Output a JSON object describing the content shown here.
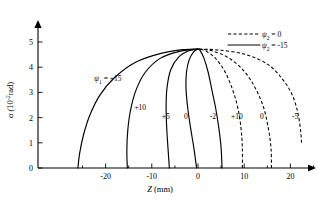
{
  "figure": {
    "title": "",
    "background_color": "#ffffff",
    "line_color": "#000000"
  },
  "axes": {
    "x": {
      "label_symbol": "Z",
      "label_units": "(mm)",
      "label_full": "Z (mm)",
      "ticks": [
        -20,
        -10,
        0,
        10,
        20
      ],
      "tick_labels": [
        "-20",
        "-10",
        "0",
        "10",
        "20"
      ],
      "minor_ticks": [
        -25,
        -15,
        -5,
        5,
        15,
        25
      ],
      "range": [
        -27,
        24
      ]
    },
    "y": {
      "label_symbol": "α",
      "label_units": "(10⁻² rad)",
      "label_full": "α (10⁻² rad)",
      "label_base": "10",
      "label_exponent": "-2",
      "label_unit_name": "rad",
      "ticks": [
        0,
        1,
        2,
        3,
        4,
        5
      ],
      "tick_labels": [
        "0",
        "1",
        "2",
        "3",
        "4",
        "5"
      ],
      "range": [
        0,
        5.5
      ]
    }
  },
  "legend": {
    "position": "top-right",
    "entries": [
      {
        "symbol": "ψ",
        "subscript": "2",
        "equals": "=",
        "value": "0",
        "text": "ψ₂ = 0",
        "style": "dashed"
      },
      {
        "symbol": "ψ",
        "subscript": "2",
        "equals": "=",
        "value": "-15",
        "text": "ψ₂ = -15",
        "style": "solid"
      }
    ]
  },
  "chart_data": {
    "type": "line",
    "title": "",
    "xlabel": "Z (mm)",
    "ylabel": "α (10⁻² rad)",
    "xlim": [
      -27,
      24
    ],
    "ylim": [
      0,
      5.5
    ],
    "grid": false,
    "legend_position": "top-right",
    "convergence_point": {
      "z": 0.0,
      "alpha": 4.72
    },
    "series": [
      {
        "name": "ψ₁ = +15",
        "label": "ψ₁ = +15",
        "style": "solid",
        "label_position": {
          "z": -19.5,
          "alpha": 3.45
        },
        "points": [
          {
            "z": -26.0,
            "alpha": 0.0
          },
          {
            "z": -25.6,
            "alpha": 0.6
          },
          {
            "z": -24.8,
            "alpha": 1.3
          },
          {
            "z": -23.4,
            "alpha": 2.1
          },
          {
            "z": -21.2,
            "alpha": 2.9
          },
          {
            "z": -18.0,
            "alpha": 3.6
          },
          {
            "z": -13.5,
            "alpha": 4.2
          },
          {
            "z": -8.0,
            "alpha": 4.55
          },
          {
            "z": -3.0,
            "alpha": 4.7
          },
          {
            "z": 0.0,
            "alpha": 4.72
          }
        ]
      },
      {
        "name": "+10",
        "label": "+10",
        "style": "solid",
        "label_position": {
          "z": -12.5,
          "alpha": 2.3
        },
        "points": [
          {
            "z": -15.3,
            "alpha": 0.0
          },
          {
            "z": -15.4,
            "alpha": 0.7
          },
          {
            "z": -15.2,
            "alpha": 1.5
          },
          {
            "z": -14.6,
            "alpha": 2.3
          },
          {
            "z": -13.4,
            "alpha": 3.1
          },
          {
            "z": -11.4,
            "alpha": 3.8
          },
          {
            "z": -8.2,
            "alpha": 4.35
          },
          {
            "z": -4.2,
            "alpha": 4.62
          },
          {
            "z": 0.0,
            "alpha": 4.72
          }
        ]
      },
      {
        "name": "+5",
        "label": "+5",
        "style": "solid",
        "label_position": {
          "z": -7.0,
          "alpha": 1.95
        },
        "points": [
          {
            "z": -6.2,
            "alpha": 0.0
          },
          {
            "z": -6.5,
            "alpha": 0.8
          },
          {
            "z": -6.8,
            "alpha": 1.7
          },
          {
            "z": -6.9,
            "alpha": 2.5
          },
          {
            "z": -6.7,
            "alpha": 3.2
          },
          {
            "z": -5.9,
            "alpha": 3.9
          },
          {
            "z": -4.2,
            "alpha": 4.4
          },
          {
            "z": -2.0,
            "alpha": 4.65
          },
          {
            "z": 0.0,
            "alpha": 4.72
          }
        ]
      },
      {
        "name": "0",
        "label": "0",
        "style": "solid",
        "label_position": {
          "z": -2.6,
          "alpha": 1.95
        },
        "points": [
          {
            "z": -0.3,
            "alpha": 0.0
          },
          {
            "z": -0.9,
            "alpha": 0.8
          },
          {
            "z": -1.7,
            "alpha": 1.7
          },
          {
            "z": -2.3,
            "alpha": 2.5
          },
          {
            "z": -2.6,
            "alpha": 3.2
          },
          {
            "z": -2.5,
            "alpha": 3.8
          },
          {
            "z": -1.9,
            "alpha": 4.3
          },
          {
            "z": -0.9,
            "alpha": 4.62
          },
          {
            "z": 0.0,
            "alpha": 4.72
          }
        ]
      },
      {
        "name": "-2",
        "label": "-2",
        "style": "solid",
        "label_position": {
          "z": 3.2,
          "alpha": 1.95
        },
        "points": [
          {
            "z": 5.2,
            "alpha": 0.0
          },
          {
            "z": 5.0,
            "alpha": 0.8
          },
          {
            "z": 4.5,
            "alpha": 1.6
          },
          {
            "z": 3.8,
            "alpha": 2.4
          },
          {
            "z": 3.0,
            "alpha": 3.1
          },
          {
            "z": 2.2,
            "alpha": 3.8
          },
          {
            "z": 1.3,
            "alpha": 4.35
          },
          {
            "z": 0.5,
            "alpha": 4.65
          },
          {
            "z": 0.0,
            "alpha": 4.72
          }
        ]
      },
      {
        "name": "+10",
        "label": "+10",
        "style": "dashed",
        "label_position": {
          "z": 8.4,
          "alpha": 1.95
        },
        "points": [
          {
            "z": 9.6,
            "alpha": 0.0
          },
          {
            "z": 9.6,
            "alpha": 0.8
          },
          {
            "z": 9.3,
            "alpha": 1.6
          },
          {
            "z": 8.6,
            "alpha": 2.4
          },
          {
            "z": 7.5,
            "alpha": 3.1
          },
          {
            "z": 5.9,
            "alpha": 3.8
          },
          {
            "z": 3.8,
            "alpha": 4.35
          },
          {
            "z": 1.6,
            "alpha": 4.65
          },
          {
            "z": 0.0,
            "alpha": 4.72
          }
        ]
      },
      {
        "name": "0",
        "label": "0",
        "style": "dashed",
        "label_position": {
          "z": 13.8,
          "alpha": 1.95
        },
        "points": [
          {
            "z": 15.9,
            "alpha": 0.0
          },
          {
            "z": 15.8,
            "alpha": 0.8
          },
          {
            "z": 15.2,
            "alpha": 1.6
          },
          {
            "z": 14.2,
            "alpha": 2.4
          },
          {
            "z": 12.6,
            "alpha": 3.1
          },
          {
            "z": 10.2,
            "alpha": 3.8
          },
          {
            "z": 6.8,
            "alpha": 4.35
          },
          {
            "z": 3.0,
            "alpha": 4.65
          },
          {
            "z": 0.0,
            "alpha": 4.72
          }
        ]
      },
      {
        "name": "-5",
        "label": "-5",
        "style": "dashed",
        "label_position": {
          "z": 21.0,
          "alpha": 1.95
        },
        "points": [
          {
            "z": 22.4,
            "alpha": 1.0
          },
          {
            "z": 22.2,
            "alpha": 1.5
          },
          {
            "z": 21.6,
            "alpha": 2.2
          },
          {
            "z": 20.4,
            "alpha": 2.9
          },
          {
            "z": 18.4,
            "alpha": 3.5
          },
          {
            "z": 15.2,
            "alpha": 4.1
          },
          {
            "z": 10.4,
            "alpha": 4.5
          },
          {
            "z": 4.6,
            "alpha": 4.68
          },
          {
            "z": 0.0,
            "alpha": 4.72
          }
        ]
      }
    ]
  }
}
